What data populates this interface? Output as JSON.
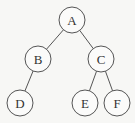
{
  "diagram": {
    "type": "binary-tree",
    "nodes": [
      {
        "id": "A",
        "label": "A",
        "x": 72,
        "y": 20
      },
      {
        "id": "B",
        "label": "B",
        "x": 38,
        "y": 59
      },
      {
        "id": "C",
        "label": "C",
        "x": 101,
        "y": 59
      },
      {
        "id": "D",
        "label": "D",
        "x": 20,
        "y": 103
      },
      {
        "id": "E",
        "label": "E",
        "x": 85,
        "y": 103
      },
      {
        "id": "F",
        "label": "F",
        "x": 117,
        "y": 103
      }
    ],
    "edges": [
      {
        "from": "A",
        "to": "B"
      },
      {
        "from": "A",
        "to": "C"
      },
      {
        "from": "B",
        "to": "D"
      },
      {
        "from": "C",
        "to": "E"
      },
      {
        "from": "C",
        "to": "F"
      }
    ],
    "radius": 13
  }
}
